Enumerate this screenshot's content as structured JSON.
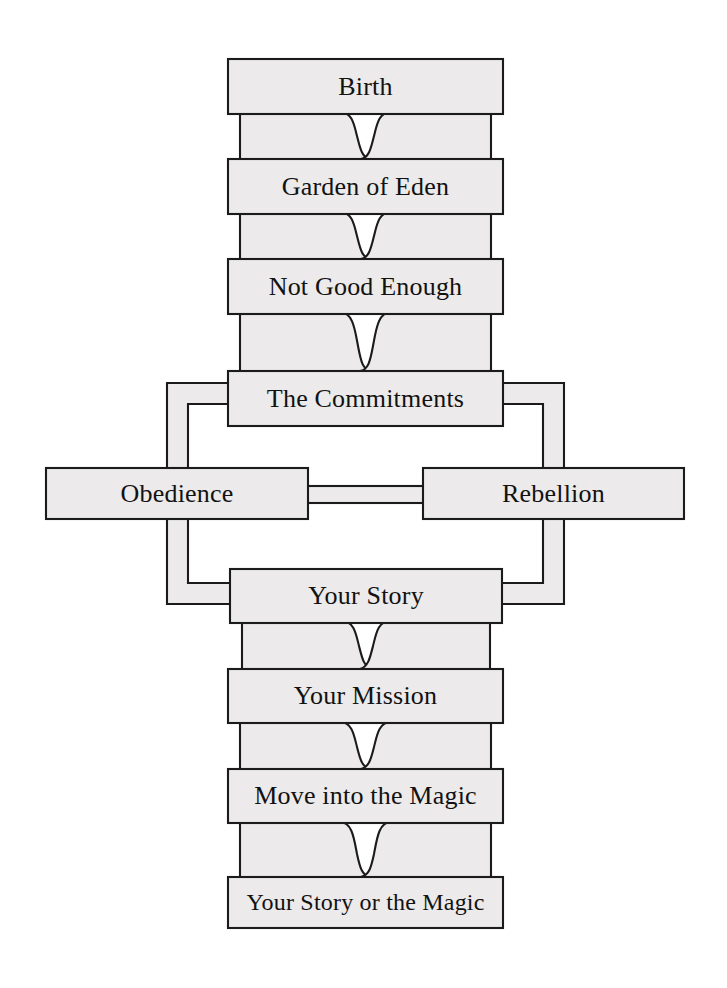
{
  "diagram": {
    "style": {
      "box_fill": "#eceaea",
      "box_stroke": "#1b1b1b",
      "text_color": "#121212",
      "page_background": "#ffffff"
    },
    "nodes": [
      {
        "id": "birth",
        "label": "Birth",
        "x": 228,
        "y": 59,
        "w": 275,
        "h": 55
      },
      {
        "id": "garden",
        "label": "Garden of Eden",
        "x": 228,
        "y": 159,
        "w": 275,
        "h": 55
      },
      {
        "id": "not-good",
        "label": "Not Good Enough",
        "x": 228,
        "y": 259,
        "w": 275,
        "h": 55
      },
      {
        "id": "commitments",
        "label": "The Commitments",
        "x": 228,
        "y": 371,
        "w": 275,
        "h": 55
      },
      {
        "id": "obedience",
        "label": "Obedience",
        "x": 46,
        "y": 468,
        "w": 262,
        "h": 51
      },
      {
        "id": "rebellion",
        "label": "Rebellion",
        "x": 423,
        "y": 468,
        "w": 261,
        "h": 51
      },
      {
        "id": "your-story",
        "label": "Your Story",
        "x": 230,
        "y": 569,
        "w": 272,
        "h": 54
      },
      {
        "id": "your-mission",
        "label": "Your Mission",
        "x": 228,
        "y": 669,
        "w": 275,
        "h": 54
      },
      {
        "id": "move-magic",
        "label": "Move into the Magic",
        "x": 228,
        "y": 769,
        "w": 275,
        "h": 54
      },
      {
        "id": "story-magic",
        "label": "Your Story or the Magic",
        "x": 228,
        "y": 877,
        "w": 275,
        "h": 51
      }
    ],
    "connectors": [
      {
        "id": "birth-to-garden",
        "from": "birth",
        "to": "garden"
      },
      {
        "id": "garden-to-not-good",
        "from": "garden",
        "to": "not-good"
      },
      {
        "id": "not-good-to-commitments",
        "from": "not-good",
        "to": "commitments"
      },
      {
        "id": "story-to-mission",
        "from": "your-story",
        "to": "your-mission"
      },
      {
        "id": "mission-to-move-magic",
        "from": "your-mission",
        "to": "move-magic"
      },
      {
        "id": "move-magic-to-story-magic",
        "from": "move-magic",
        "to": "story-magic"
      }
    ],
    "branches": [
      {
        "id": "commitments-to-obedience",
        "from": "commitments",
        "to": "obedience",
        "side": "left"
      },
      {
        "id": "commitments-to-rebellion",
        "from": "commitments",
        "to": "rebellion",
        "side": "right"
      },
      {
        "id": "obedience-to-your-story",
        "from": "obedience",
        "to": "your-story",
        "side": "left"
      },
      {
        "id": "rebellion-to-your-story",
        "from": "rebellion",
        "to": "your-story",
        "side": "right"
      },
      {
        "id": "obedience-rebellion-link",
        "from": "obedience",
        "to": "rebellion",
        "side": "center"
      }
    ]
  }
}
